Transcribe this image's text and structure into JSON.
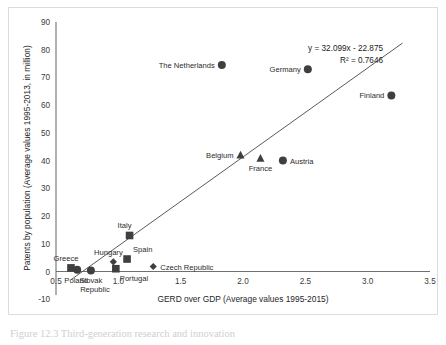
{
  "figure": {
    "caption": "Figure 12.3  Third-generation research and innovation",
    "background_color": "#ffffff",
    "frame_color": "#dcdcdc"
  },
  "chart_data": {
    "type": "scatter",
    "title": "",
    "xlabel": "GERD over GDP (Average values 1995-2015)",
    "ylabel": "Patents by population (Average values 1995-2013, in million)",
    "xlim": [
      0.5,
      3.5
    ],
    "ylim": [
      -10,
      90
    ],
    "xticks": [
      "0.5",
      "1.0",
      "1.5",
      "2.0",
      "2.5",
      "3.0",
      "3.5"
    ],
    "xtick_values": [
      0.5,
      1.0,
      1.5,
      2.0,
      2.5,
      3.0,
      3.5
    ],
    "yticks": [
      "-10",
      "0",
      "10",
      "20",
      "30",
      "40",
      "50",
      "60",
      "70",
      "80",
      "90"
    ],
    "ytick_values": [
      -10,
      0,
      10,
      20,
      30,
      40,
      50,
      60,
      70,
      80,
      90
    ],
    "grid": false,
    "legend": "none",
    "marker_color": "#3f3f3f",
    "trendline": {
      "equation": "y = 32.099x - 22.875",
      "r_squared_label": "R² = 0.7646",
      "slope": 32.099,
      "intercept": -22.875,
      "r_squared": 0.7646,
      "x_start": 0.62,
      "x_end": 3.28,
      "color": "#5a5a5a"
    },
    "points": [
      {
        "label": "The Netherlands",
        "x": 1.83,
        "y": 74.5,
        "marker": "circle",
        "label_position": "left"
      },
      {
        "label": "Germany",
        "x": 2.52,
        "y": 73.0,
        "marker": "circle",
        "label_position": "left"
      },
      {
        "label": "Finland",
        "x": 3.19,
        "y": 63.5,
        "marker": "circle",
        "label_position": "left"
      },
      {
        "label": "Belgium",
        "x": 1.98,
        "y": 42.0,
        "marker": "triangle",
        "label_position": "left"
      },
      {
        "label": "France",
        "x": 2.14,
        "y": 40.8,
        "marker": "triangle",
        "label_position": "below"
      },
      {
        "label": "Austria",
        "x": 2.32,
        "y": 40.0,
        "marker": "circle",
        "label_position": "right"
      },
      {
        "label": "Italy",
        "x": 1.09,
        "y": 13.0,
        "marker": "square",
        "label_position": "above-left"
      },
      {
        "label": "Spain",
        "x": 1.07,
        "y": 4.5,
        "marker": "square",
        "label_position": "above-right"
      },
      {
        "label": "Hungary",
        "x": 0.96,
        "y": 3.5,
        "marker": "diamond",
        "label_position": "above-left"
      },
      {
        "label": "Czech Republic",
        "x": 1.28,
        "y": 1.8,
        "marker": "diamond",
        "label_position": "right"
      },
      {
        "label": "Greece",
        "x": 0.62,
        "y": 1.3,
        "marker": "square",
        "label_position": "above-left"
      },
      {
        "label": "Poland",
        "x": 0.67,
        "y": 0.6,
        "marker": "circle",
        "label_position": "below-left"
      },
      {
        "label": "Slovak Republic",
        "x": 0.78,
        "y": 0.4,
        "marker": "circle",
        "label_position": "below"
      },
      {
        "label": "Portugal",
        "x": 0.98,
        "y": 1.0,
        "marker": "square",
        "label_position": "below-right"
      }
    ]
  }
}
